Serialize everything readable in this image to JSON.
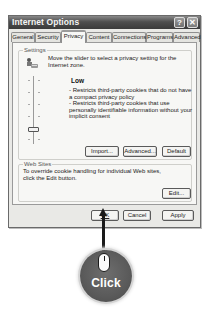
{
  "window": {
    "title": "Internet Options",
    "help_button": "?",
    "close_button": "✕"
  },
  "tabs": [
    {
      "label": "General",
      "active": false
    },
    {
      "label": "Security",
      "active": false
    },
    {
      "label": "Privacy",
      "active": true
    },
    {
      "label": "Content",
      "active": false
    },
    {
      "label": "Connections",
      "active": false
    },
    {
      "label": "Programs",
      "active": false
    },
    {
      "label": "Advanced",
      "active": false
    }
  ],
  "settings": {
    "group_label": "Settings",
    "intro": "Move the slider to select a privacy setting for the Internet zone.",
    "level": {
      "title": "Low",
      "bullets": [
        "- Restricts third-party cookies that do not have a compact privacy policy",
        "- Restricts third-party cookies that use personally identifiable information without your implicit consent"
      ]
    },
    "slider_position": "Low",
    "buttons": {
      "import": "Import...",
      "advanced": "Advanced...",
      "default": "Default"
    }
  },
  "web_sites": {
    "group_label": "Web Sites",
    "text": "To override cookie handling for individual Web sites, click the Edit button.",
    "edit_button": "Edit..."
  },
  "footer": {
    "ok": "OK",
    "cancel": "Cancel",
    "apply": "Apply"
  },
  "annotation": {
    "label": "Click",
    "badge_color": "#5c5c5c",
    "target": "OK"
  }
}
